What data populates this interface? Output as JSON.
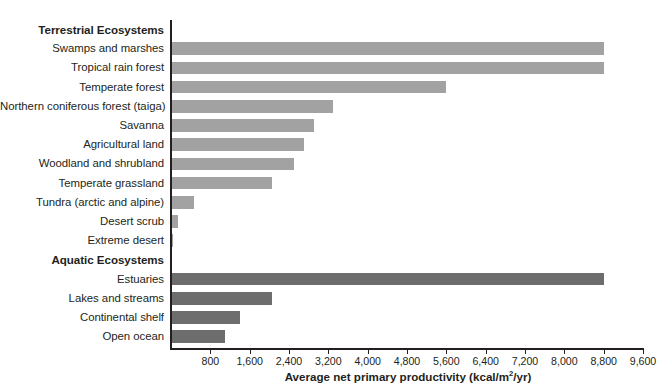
{
  "chart_data": {
    "type": "bar",
    "orientation": "horizontal",
    "title": "",
    "xlabel": "Average net primary productivity (kcal/m2/yr)",
    "xlabel_parts": {
      "main": "Average net primary productivity (kcal/m",
      "sup": "2",
      "tail": "/yr)"
    },
    "ylabel": "",
    "xlim": [
      0,
      9600
    ],
    "xticks": [
      800,
      1600,
      2400,
      3200,
      4000,
      4800,
      5600,
      6400,
      7200,
      8000,
      8800,
      9600
    ],
    "xtick_labels": [
      "800",
      "1,600",
      "2,400",
      "3,200",
      "4,000",
      "4,800",
      "5,600",
      "6,400",
      "7,200",
      "8,000",
      "8,800",
      "9,600"
    ],
    "grid": false,
    "legend": "none",
    "groups": [
      {
        "name": "Terrestrial Ecosystems",
        "color": "#a2a2a2",
        "categories": [
          "Swamps and marshes",
          "Tropical rain forest",
          "Temperate forest",
          "Northern coniferous forest (taiga)",
          "Savanna",
          "Agricultural land",
          "Woodland and shrubland",
          "Temperate grassland",
          "Tundra (arctic and alpine)",
          "Desert scrub",
          "Extreme desert"
        ],
        "values": [
          8800,
          8800,
          5600,
          3300,
          2900,
          2700,
          2500,
          2050,
          470,
          140,
          40
        ]
      },
      {
        "name": "Aquatic Ecosystems",
        "color": "#6d6d6d",
        "categories": [
          "Estuaries",
          "Lakes and streams",
          "Continental shelf",
          "Open ocean"
        ],
        "values": [
          8800,
          2050,
          1400,
          1100
        ]
      }
    ]
  },
  "rows": [
    {
      "kind": "group",
      "label": "Terrestrial Ecosystems"
    },
    {
      "kind": "bar",
      "label": "Swamps and marshes",
      "value": 8800,
      "series": "terrestrial"
    },
    {
      "kind": "bar",
      "label": "Tropical rain forest",
      "value": 8800,
      "series": "terrestrial"
    },
    {
      "kind": "bar",
      "label": "Temperate forest",
      "value": 5600,
      "series": "terrestrial"
    },
    {
      "kind": "bar",
      "label": "Northern coniferous forest (taiga)",
      "value": 3300,
      "series": "terrestrial"
    },
    {
      "kind": "bar",
      "label": "Savanna",
      "value": 2900,
      "series": "terrestrial"
    },
    {
      "kind": "bar",
      "label": "Agricultural land",
      "value": 2700,
      "series": "terrestrial"
    },
    {
      "kind": "bar",
      "label": "Woodland and shrubland",
      "value": 2500,
      "series": "terrestrial"
    },
    {
      "kind": "bar",
      "label": "Temperate grassland",
      "value": 2050,
      "series": "terrestrial"
    },
    {
      "kind": "bar",
      "label": "Tundra (arctic and alpine)",
      "value": 470,
      "series": "terrestrial"
    },
    {
      "kind": "bar",
      "label": "Desert scrub",
      "value": 140,
      "series": "terrestrial"
    },
    {
      "kind": "bar",
      "label": "Extreme desert",
      "value": 40,
      "series": "terrestrial"
    },
    {
      "kind": "group",
      "label": "Aquatic Ecosystems"
    },
    {
      "kind": "bar",
      "label": "Estuaries",
      "value": 8800,
      "series": "aquatic"
    },
    {
      "kind": "bar",
      "label": "Lakes and streams",
      "value": 2050,
      "series": "aquatic"
    },
    {
      "kind": "bar",
      "label": "Continental shelf",
      "value": 1400,
      "series": "aquatic"
    },
    {
      "kind": "bar",
      "label": "Open ocean",
      "value": 1100,
      "series": "aquatic"
    }
  ],
  "colors": {
    "terrestrial_bar": "#a2a2a2",
    "aquatic_bar": "#6d6d6d",
    "axis": "#231f20",
    "text": "#231f20",
    "background": "#ffffff"
  }
}
